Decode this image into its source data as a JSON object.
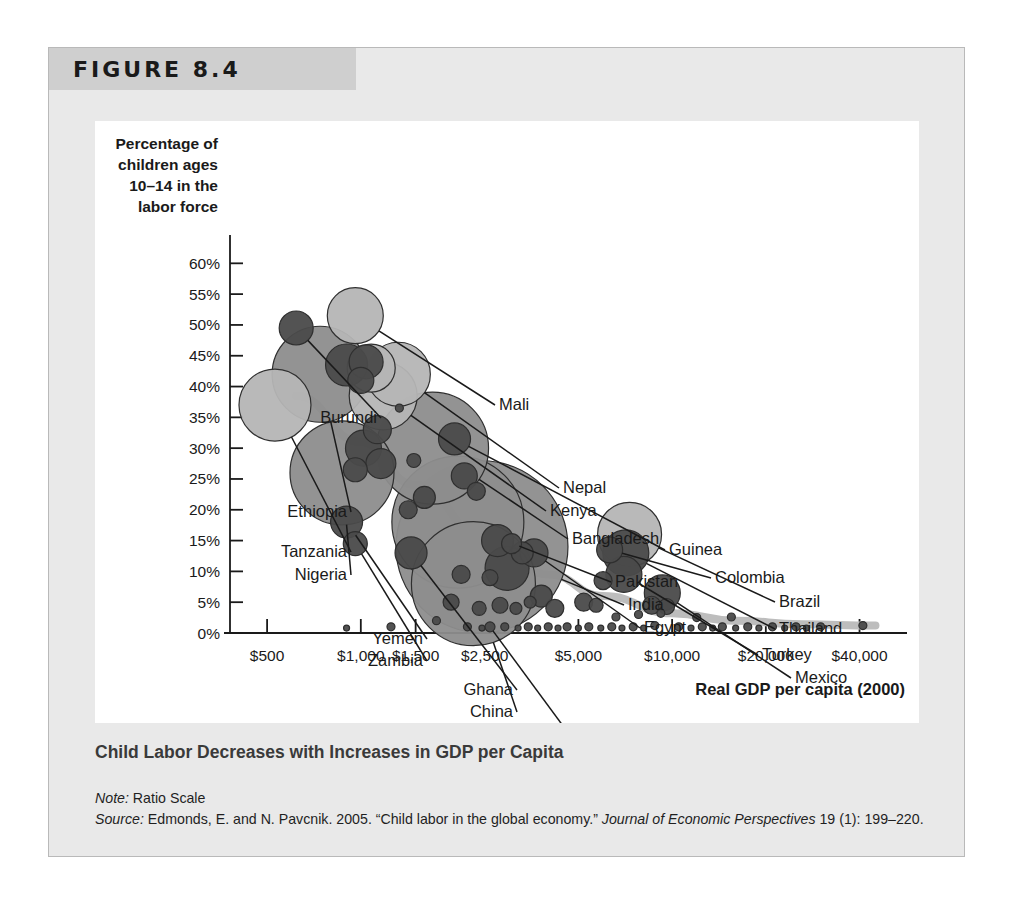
{
  "figure": {
    "header_label": "FIGURE 8.4",
    "caption": "Child Labor Decreases with Increases in GDP per Capita",
    "note_label": "Note:",
    "note_text": " Ratio Scale",
    "source_label": "Source:",
    "source_text": " Edmonds, E. and N. Pavcnik. 2005. “Child labor in the global economy.” ",
    "source_journal": "Journal of Economic Perspectives",
    "source_tail": " 19 (1): 199–220."
  },
  "chart_data": {
    "type": "scatter",
    "title": "Child Labor Decreases with Increases in GDP per Capita",
    "subtitle": "",
    "xlabel": "Real GDP per capita (2000)",
    "ylabel": "Percentage of children ages 10–14 in the labor force",
    "ylabel_lines": [
      "Percentage of",
      "children ages",
      "10–14 in the",
      "labor force"
    ],
    "x_scale": "log",
    "x_note": "Ratio Scale",
    "xticks": [
      "$500",
      "$1,000",
      "$1,500",
      "$2,500",
      "$5,000",
      "$10,000",
      "$20,000",
      "$40,000"
    ],
    "xtick_values": [
      500,
      1000,
      1500,
      2500,
      5000,
      10000,
      20000,
      40000
    ],
    "yticks": [
      "0%",
      "5%",
      "10%",
      "15%",
      "20%",
      "25%",
      "30%",
      "35%",
      "40%",
      "45%",
      "50%",
      "55%",
      "60%"
    ],
    "ytick_values": [
      0,
      5,
      10,
      15,
      20,
      25,
      30,
      35,
      40,
      45,
      50,
      55,
      60
    ],
    "ylim": [
      0,
      62
    ],
    "xlim": [
      380,
      52000
    ],
    "grid": false,
    "legend": "none",
    "bubble_note": "Bubble area encodes child population size",
    "colors": {
      "bubble_light": "#b5b5b5",
      "bubble_mid": "#8d8d8d",
      "bubble_dark": "#4a4a4a",
      "bubble_stroke": "#2f2f2f",
      "trend_line": "#bdbdbd",
      "axis": "#1a1a1a",
      "panel_bg": "#e9e9e9",
      "header_bg": "#cfcfcf",
      "plot_bg": "#ffffff",
      "caption_text": "#3a3a3a"
    },
    "points": [
      {
        "name": "Burundi",
        "gdp": 620,
        "pct": 49.5,
        "r": 17,
        "shade": "dark",
        "label": true,
        "lx": 282,
        "ly": 302,
        "anchor": "end"
      },
      {
        "name": "Mali",
        "gdp": 960,
        "pct": 51.5,
        "r": 28,
        "shade": "light",
        "label": true,
        "lx": 404,
        "ly": 289,
        "anchor": "start"
      },
      {
        "name": "Ethiopia",
        "gdp": 740,
        "pct": 42.0,
        "r": 48,
        "shade": "mid",
        "label": true,
        "lx": 252,
        "ly": 396,
        "anchor": "end"
      },
      {
        "name": "Tanzania",
        "gdp": 530,
        "pct": 37.0,
        "r": 36,
        "shade": "light",
        "label": true,
        "lx": 252,
        "ly": 436,
        "anchor": "end"
      },
      {
        "name": "Nigeria",
        "gdp": 870,
        "pct": 26.0,
        "r": 52,
        "shade": "mid",
        "label": true,
        "lx": 252,
        "ly": 459,
        "anchor": "end"
      },
      {
        "name": "Nepal",
        "gdp": 1320,
        "pct": 42.0,
        "r": 32,
        "shade": "light",
        "label": true,
        "lx": 468,
        "ly": 372,
        "anchor": "start"
      },
      {
        "name": "Kenya",
        "gdp": 1180,
        "pct": 38.5,
        "r": 34,
        "shade": "light",
        "label": true,
        "lx": 455,
        "ly": 395,
        "anchor": "start"
      },
      {
        "name": "Bangladesh",
        "gdp": 1700,
        "pct": 30.0,
        "r": 56,
        "shade": "mid",
        "label": true,
        "lx": 477,
        "ly": 423,
        "anchor": "start"
      },
      {
        "name": "Guinea",
        "gdp": 2000,
        "pct": 31.5,
        "r": 16,
        "shade": "dark",
        "label": true,
        "lx": 574,
        "ly": 434,
        "anchor": "start"
      },
      {
        "name": "Pakistan",
        "gdp": 2050,
        "pct": 18.0,
        "r": 66,
        "shade": "mid",
        "label": true,
        "lx": 520,
        "ly": 466,
        "anchor": "start"
      },
      {
        "name": "India",
        "gdp": 2450,
        "pct": 14.0,
        "r": 86,
        "shade": "mid",
        "label": true,
        "lx": 533,
        "ly": 489,
        "anchor": "start"
      },
      {
        "name": "Egypt",
        "gdp": 3600,
        "pct": 13.0,
        "r": 14,
        "shade": "dark",
        "label": true,
        "lx": 549,
        "ly": 512,
        "anchor": "start"
      },
      {
        "name": "Colombia",
        "gdp": 6300,
        "pct": 13.5,
        "r": 13,
        "shade": "dark",
        "label": true,
        "lx": 620,
        "ly": 462,
        "anchor": "start"
      },
      {
        "name": "Brazil",
        "gdp": 7300,
        "pct": 16.0,
        "r": 32,
        "shade": "light",
        "label": true,
        "lx": 684,
        "ly": 486,
        "anchor": "start"
      },
      {
        "name": "Thailand",
        "gdp": 7100,
        "pct": 13.0,
        "r": 23,
        "shade": "dark",
        "label": true,
        "lx": 684,
        "ly": 513,
        "anchor": "start"
      },
      {
        "name": "Turkey",
        "gdp": 7000,
        "pct": 9.5,
        "r": 18,
        "shade": "dark",
        "label": true,
        "lx": 667,
        "ly": 539,
        "anchor": "start"
      },
      {
        "name": "Mexico",
        "gdp": 9300,
        "pct": 6.5,
        "r": 18,
        "shade": "dark",
        "label": true,
        "lx": 700,
        "ly": 562,
        "anchor": "start"
      },
      {
        "name": "Yemen",
        "gdp": 900,
        "pct": 18.0,
        "r": 16,
        "shade": "dark",
        "label": true,
        "lx": 328,
        "ly": 523,
        "anchor": "end"
      },
      {
        "name": "Zambia",
        "gdp": 960,
        "pct": 14.5,
        "r": 12,
        "shade": "dark",
        "label": true,
        "lx": 328,
        "ly": 545,
        "anchor": "end"
      },
      {
        "name": "Ghana",
        "gdp": 1450,
        "pct": 13.0,
        "r": 16,
        "shade": "dark",
        "label": true,
        "lx": 418,
        "ly": 574,
        "anchor": "end"
      },
      {
        "name": "China",
        "gdp": 2300,
        "pct": 8.0,
        "r": 62,
        "shade": "mid",
        "label": true,
        "lx": 418,
        "ly": 596,
        "anchor": "end"
      },
      {
        "name": "Philippines",
        "gdp": 2600,
        "pct": 1.0,
        "r": 5,
        "shade": "dark",
        "label": true,
        "lx": 470,
        "ly": 618,
        "anchor": "end"
      }
    ],
    "unlabeled_points": [
      {
        "gdp": 900,
        "pct": 43.5,
        "r": 21,
        "shade": "dark"
      },
      {
        "gdp": 1040,
        "pct": 44.0,
        "r": 17,
        "shade": "dark"
      },
      {
        "gdp": 1000,
        "pct": 41.0,
        "r": 13,
        "shade": "dark"
      },
      {
        "gdp": 1080,
        "pct": 43.0,
        "r": 24,
        "shade": "light"
      },
      {
        "gdp": 1130,
        "pct": 33.0,
        "r": 14,
        "shade": "dark"
      },
      {
        "gdp": 1020,
        "pct": 30.0,
        "r": 18,
        "shade": "dark"
      },
      {
        "gdp": 1160,
        "pct": 27.5,
        "r": 15,
        "shade": "dark"
      },
      {
        "gdp": 960,
        "pct": 26.5,
        "r": 12,
        "shade": "dark"
      },
      {
        "gdp": 1480,
        "pct": 28.0,
        "r": 7,
        "shade": "dark"
      },
      {
        "gdp": 1330,
        "pct": 36.5,
        "r": 4,
        "shade": "dark"
      },
      {
        "gdp": 1600,
        "pct": 22.0,
        "r": 11,
        "shade": "dark"
      },
      {
        "gdp": 1420,
        "pct": 20.0,
        "r": 9,
        "shade": "dark"
      },
      {
        "gdp": 2150,
        "pct": 25.5,
        "r": 13,
        "shade": "dark"
      },
      {
        "gdp": 2350,
        "pct": 23.0,
        "r": 9,
        "shade": "dark"
      },
      {
        "gdp": 2750,
        "pct": 15.0,
        "r": 16,
        "shade": "dark"
      },
      {
        "gdp": 3050,
        "pct": 14.5,
        "r": 10,
        "shade": "dark"
      },
      {
        "gdp": 3300,
        "pct": 13.0,
        "r": 11,
        "shade": "dark"
      },
      {
        "gdp": 2950,
        "pct": 10.5,
        "r": 22,
        "shade": "dark"
      },
      {
        "gdp": 2600,
        "pct": 9.0,
        "r": 8,
        "shade": "dark"
      },
      {
        "gdp": 2100,
        "pct": 9.5,
        "r": 9,
        "shade": "dark"
      },
      {
        "gdp": 1950,
        "pct": 5.0,
        "r": 8,
        "shade": "dark"
      },
      {
        "gdp": 2400,
        "pct": 4.0,
        "r": 7,
        "shade": "dark"
      },
      {
        "gdp": 2800,
        "pct": 4.5,
        "r": 8,
        "shade": "dark"
      },
      {
        "gdp": 3150,
        "pct": 4.0,
        "r": 6,
        "shade": "dark"
      },
      {
        "gdp": 3500,
        "pct": 5.0,
        "r": 6,
        "shade": "dark"
      },
      {
        "gdp": 3800,
        "pct": 6.0,
        "r": 11,
        "shade": "dark"
      },
      {
        "gdp": 4200,
        "pct": 4.0,
        "r": 9,
        "shade": "dark"
      },
      {
        "gdp": 5200,
        "pct": 5.0,
        "r": 9,
        "shade": "dark"
      },
      {
        "gdp": 5700,
        "pct": 4.5,
        "r": 7,
        "shade": "dark"
      },
      {
        "gdp": 1750,
        "pct": 2.0,
        "r": 4,
        "shade": "dark"
      },
      {
        "gdp": 1250,
        "pct": 1.0,
        "r": 4,
        "shade": "dark"
      },
      {
        "gdp": 900,
        "pct": 0.8,
        "r": 3,
        "shade": "dark"
      },
      {
        "gdp": 2200,
        "pct": 1.0,
        "r": 4,
        "shade": "dark"
      },
      {
        "gdp": 2450,
        "pct": 0.8,
        "r": 3,
        "shade": "dark"
      },
      {
        "gdp": 2900,
        "pct": 1.0,
        "r": 4,
        "shade": "dark"
      },
      {
        "gdp": 3200,
        "pct": 0.8,
        "r": 3,
        "shade": "dark"
      },
      {
        "gdp": 3450,
        "pct": 1.0,
        "r": 4,
        "shade": "dark"
      },
      {
        "gdp": 3700,
        "pct": 0.8,
        "r": 3,
        "shade": "dark"
      },
      {
        "gdp": 4000,
        "pct": 1.0,
        "r": 4,
        "shade": "dark"
      },
      {
        "gdp": 4300,
        "pct": 0.8,
        "r": 3,
        "shade": "dark"
      },
      {
        "gdp": 4600,
        "pct": 1.0,
        "r": 4,
        "shade": "dark"
      },
      {
        "gdp": 5000,
        "pct": 0.8,
        "r": 3,
        "shade": "dark"
      },
      {
        "gdp": 5400,
        "pct": 1.0,
        "r": 4,
        "shade": "dark"
      },
      {
        "gdp": 5900,
        "pct": 0.8,
        "r": 3,
        "shade": "dark"
      },
      {
        "gdp": 6400,
        "pct": 1.0,
        "r": 4,
        "shade": "dark"
      },
      {
        "gdp": 6900,
        "pct": 0.8,
        "r": 3,
        "shade": "dark"
      },
      {
        "gdp": 7500,
        "pct": 1.0,
        "r": 4,
        "shade": "dark"
      },
      {
        "gdp": 8100,
        "pct": 0.8,
        "r": 3,
        "shade": "dark"
      },
      {
        "gdp": 8800,
        "pct": 1.2,
        "r": 4,
        "shade": "dark"
      },
      {
        "gdp": 10500,
        "pct": 1.0,
        "r": 4,
        "shade": "dark"
      },
      {
        "gdp": 11500,
        "pct": 0.8,
        "r": 3,
        "shade": "dark"
      },
      {
        "gdp": 12500,
        "pct": 1.0,
        "r": 4,
        "shade": "dark"
      },
      {
        "gdp": 13500,
        "pct": 0.8,
        "r": 3,
        "shade": "dark"
      },
      {
        "gdp": 14500,
        "pct": 1.0,
        "r": 4,
        "shade": "dark"
      },
      {
        "gdp": 16000,
        "pct": 0.8,
        "r": 3,
        "shade": "dark"
      },
      {
        "gdp": 17500,
        "pct": 1.0,
        "r": 4,
        "shade": "dark"
      },
      {
        "gdp": 19000,
        "pct": 0.8,
        "r": 3,
        "shade": "dark"
      },
      {
        "gdp": 21000,
        "pct": 1.0,
        "r": 4,
        "shade": "dark"
      },
      {
        "gdp": 23000,
        "pct": 0.8,
        "r": 3,
        "shade": "dark"
      },
      {
        "gdp": 25000,
        "pct": 1.0,
        "r": 4,
        "shade": "dark"
      },
      {
        "gdp": 27000,
        "pct": 0.8,
        "r": 3,
        "shade": "dark"
      },
      {
        "gdp": 30000,
        "pct": 1.0,
        "r": 4,
        "shade": "dark"
      },
      {
        "gdp": 41000,
        "pct": 1.2,
        "r": 4,
        "shade": "dark"
      },
      {
        "gdp": 7800,
        "pct": 3.0,
        "r": 4,
        "shade": "dark"
      },
      {
        "gdp": 9200,
        "pct": 3.2,
        "r": 4,
        "shade": "dark"
      },
      {
        "gdp": 12000,
        "pct": 2.5,
        "r": 4,
        "shade": "dark"
      },
      {
        "gdp": 15500,
        "pct": 2.6,
        "r": 4,
        "shade": "dark"
      },
      {
        "gdp": 6600,
        "pct": 2.6,
        "r": 4,
        "shade": "dark"
      },
      {
        "gdp": 6000,
        "pct": 8.5,
        "r": 9,
        "shade": "dark"
      },
      {
        "gdp": 8600,
        "pct": 4.5,
        "r": 9,
        "shade": "dark"
      },
      {
        "gdp": 9600,
        "pct": 4.3,
        "r": 8,
        "shade": "dark"
      }
    ],
    "trend_line": {
      "label": "fitted trend",
      "points": [
        {
          "gdp": 620,
          "pct": 38.5
        },
        {
          "gdp": 1000,
          "pct": 31.0
        },
        {
          "gdp": 1500,
          "pct": 24.0
        },
        {
          "gdp": 2500,
          "pct": 15.5
        },
        {
          "gdp": 4000,
          "pct": 9.5
        },
        {
          "gdp": 6000,
          "pct": 6.0
        },
        {
          "gdp": 10000,
          "pct": 3.2
        },
        {
          "gdp": 16000,
          "pct": 2.0
        },
        {
          "gdp": 26000,
          "pct": 1.4
        },
        {
          "gdp": 45000,
          "pct": 1.2
        }
      ]
    }
  }
}
